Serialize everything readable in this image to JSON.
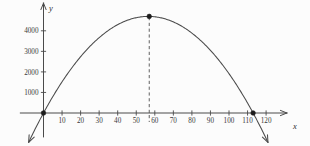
{
  "chart_data": {
    "type": "line",
    "title": "",
    "subtitle": "",
    "xlabel": "x",
    "ylabel": "y",
    "xlim": [
      -12,
      128
    ],
    "ylim": [
      -1400,
      5300
    ],
    "grid": false,
    "legend": null,
    "curve": {
      "name": "parabola",
      "shape": "downward-opening parabola",
      "equation_form": "y = a*x*(x - 113)",
      "vertex": {
        "x": 57,
        "y": 4700
      },
      "roots": [
        0,
        113
      ],
      "x": [
        -8,
        0,
        10,
        20,
        30,
        40,
        50,
        57,
        60,
        70,
        80,
        90,
        100,
        110,
        113,
        121
      ],
      "values": [
        -1170,
        0,
        1620,
        2910,
        3880,
        4530,
        4860,
        4700,
        4860,
        4530,
        3880,
        2910,
        1620,
        330,
        0,
        -1170
      ]
    },
    "annotations": [
      {
        "name": "left-root-point",
        "x": 0,
        "y": 0,
        "marker": "filled-dot"
      },
      {
        "name": "vertex-point",
        "x": 57,
        "y": 4700,
        "marker": "filled-dot"
      },
      {
        "name": "right-root-point",
        "x": 113,
        "y": 0,
        "marker": "filled-dot"
      },
      {
        "name": "vertex-dashed-line",
        "x": 57,
        "y_from": 0,
        "y_to": 4700,
        "style": "dashed"
      }
    ],
    "x_ticks": [
      10,
      20,
      30,
      40,
      50,
      60,
      70,
      80,
      90,
      100,
      110,
      120
    ],
    "x_tick_labels": [
      "10",
      "20",
      "30",
      "40",
      "50",
      "60",
      "70",
      "80",
      "90",
      "100",
      "110",
      "120"
    ],
    "y_ticks": [
      1000,
      2000,
      3000,
      4000
    ],
    "y_tick_labels": [
      "1000",
      "2000",
      "3000",
      "4000"
    ],
    "colors": {
      "curve": "#4a4a4a",
      "axis": "#4a4a4a",
      "dashed": "#5a5a5a",
      "marker": "#1c1c1c",
      "text": "#3a3a3a",
      "background": "#fcfcfc"
    }
  },
  "axes": {
    "x_name": "x",
    "y_name": "y"
  }
}
